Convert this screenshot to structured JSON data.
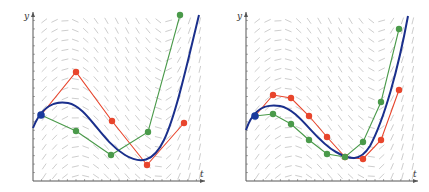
{
  "colors": {
    "exact": "#1a2f8c",
    "euler_coarse": "#e8452c",
    "euler_mid": "#4a9a4a",
    "initial_point": "#1a3a9c",
    "slope_field": "#b8b8b8",
    "axis": "#555555"
  },
  "panels": [
    {
      "id": "left",
      "x_axis_label": "t",
      "y_axis_label": "y",
      "origin": [
        33,
        181
      ],
      "x_end": 205,
      "y_end": 12,
      "exact_curve": "M33,128 C40,110 52,100 68,103 C88,107 100,140 125,155 C140,164 153,163 164,140 C176,115 188,60 199,15",
      "red_points": [
        [
          41,
          115
        ],
        [
          76,
          72
        ],
        [
          112,
          121
        ],
        [
          147,
          165
        ],
        [
          184,
          123
        ]
      ],
      "green_points": [
        [
          41,
          115
        ],
        [
          76,
          131
        ],
        [
          111,
          155
        ],
        [
          148,
          132
        ],
        [
          180,
          15
        ]
      ],
      "initial_point": [
        41,
        115
      ]
    },
    {
      "id": "right",
      "x_axis_label": "t",
      "y_axis_label": "y",
      "origin": [
        246,
        181
      ],
      "x_end": 418,
      "y_end": 12,
      "exact_curve": "M246,130 C252,112 262,103 280,106 C300,110 314,140 336,152 C350,160 360,162 370,146 C384,120 398,70 408,16",
      "red_points": [
        [
          255,
          116
        ],
        [
          273,
          95
        ],
        [
          291,
          98
        ],
        [
          309,
          116
        ],
        [
          327,
          137
        ],
        [
          345,
          157
        ],
        [
          363,
          159
        ],
        [
          381,
          140
        ],
        [
          399,
          90
        ]
      ],
      "green_points": [
        [
          255,
          116
        ],
        [
          273,
          114
        ],
        [
          291,
          124
        ],
        [
          309,
          140
        ],
        [
          327,
          154
        ],
        [
          345,
          157
        ],
        [
          363,
          142
        ],
        [
          381,
          102
        ],
        [
          399,
          29
        ]
      ],
      "initial_point": [
        255,
        116
      ]
    }
  ],
  "slope_field": {
    "cols": 16,
    "rows": 17,
    "seg_len": 7
  }
}
